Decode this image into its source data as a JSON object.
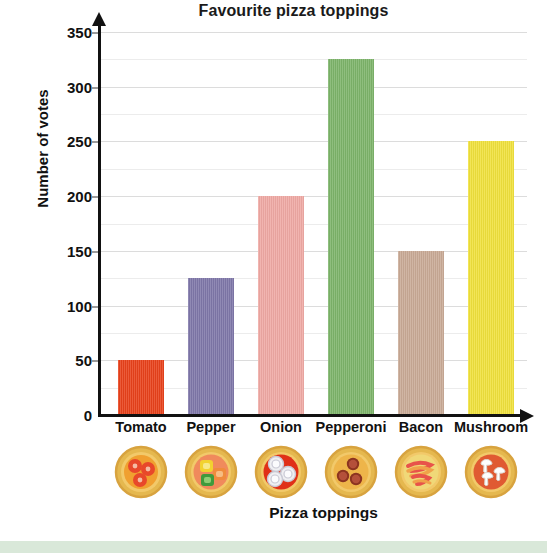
{
  "chart_data": {
    "type": "bar",
    "title": "Favourite pizza toppings",
    "xlabel": "Pizza toppings",
    "ylabel": "Number of votes",
    "categories": [
      "Tomato",
      "Pepper",
      "Onion",
      "Pepperoni",
      "Bacon",
      "Mushroom"
    ],
    "values": [
      50,
      125,
      200,
      325,
      150,
      250
    ],
    "colors": [
      "#e8411b",
      "#7f77a9",
      "#efa9a4",
      "#7db46a",
      "#c9aa96",
      "#f0e13c"
    ],
    "ylim": [
      0,
      350
    ],
    "ytick_labels": [
      "0",
      "50",
      "100",
      "150",
      "200",
      "250",
      "300",
      "350"
    ],
    "ytick_values": [
      0,
      50,
      100,
      150,
      200,
      250,
      300,
      350
    ],
    "ytick_step": 50,
    "minor_gridline_step": 25,
    "grid": true,
    "legend": "none",
    "icons": [
      "pizza-tomato-icon",
      "pizza-pepper-icon",
      "pizza-onion-icon",
      "pizza-pepperoni-icon",
      "pizza-bacon-icon",
      "pizza-mushroom-icon"
    ]
  },
  "figure": {
    "background_color": "#ffffff",
    "bottom_band_color": "#d9e8d9",
    "axis_color": "#111111",
    "gridline_color": "#dcdcdc"
  }
}
